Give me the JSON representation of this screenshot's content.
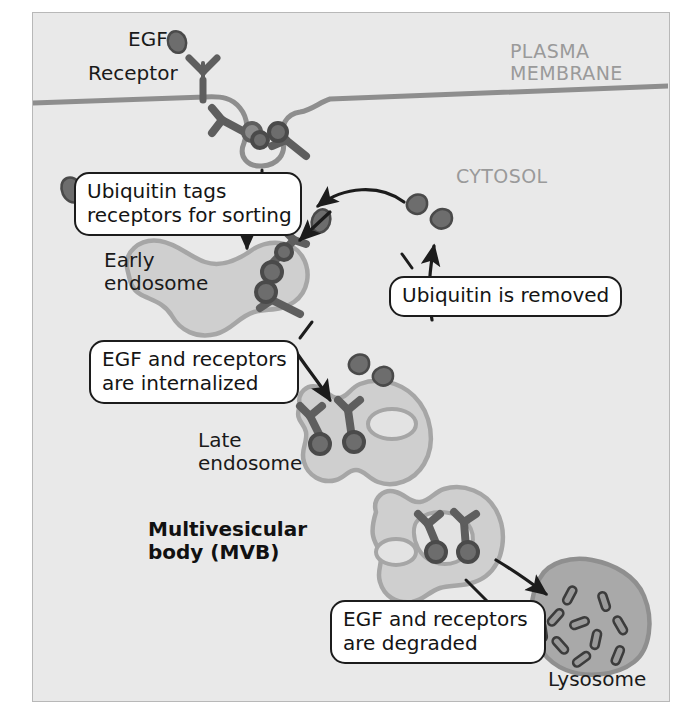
{
  "figure": {
    "title_regions": {
      "plasma_membrane": "PLASMA\nMEMBRANE",
      "cytosol": "CYTOSOL"
    },
    "labels": {
      "egf": "EGF",
      "receptor": "Receptor",
      "early_endosome": "Early\nendosome",
      "late_endosome": "Late\nendosome",
      "mvb": "Multivesicular\nbody (MVB)",
      "lysosome": "Lysosome"
    },
    "callouts": {
      "ubiquitin_tags": "Ubiquitin tags\nreceptors for sorting",
      "internalized": "EGF and receptors\nare internalized",
      "ubiquitin_removed": "Ubiquitin is removed",
      "degraded": "EGF and receptors\nare degraded"
    },
    "colors": {
      "panel_background": "#e9e9e9",
      "panel_border": "#b8b8b8",
      "membrane_line": "#8e8e8e",
      "organelle_fill": "#cfcfcf",
      "organelle_stroke": "#a6a6a6",
      "lysosome_fill": "#a9a9a9",
      "lysosome_stroke": "#8f8f8f",
      "receptor_fill": "#8a8a8a",
      "receptor_stroke": "#5e5e5e",
      "ubiquitin_fill": "#6d6d6d",
      "ubiquitin_stroke": "#4a4a4a",
      "arrow": "#1c1c1c",
      "callout_border": "#1c1c1c",
      "callout_background": "#ffffff",
      "region_text": "#9a9a9a",
      "label_text": "#1a1a1a"
    },
    "counts": {
      "free_ubiquitin_cytosol": 4,
      "lysosome_enzymes": 10,
      "membrane_receptors": 3,
      "early_endosome_receptors": 2,
      "late_endosome_receptors": 2,
      "mvb_receptors": 2
    }
  }
}
